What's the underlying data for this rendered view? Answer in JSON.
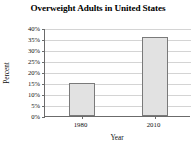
{
  "chart_data": {
    "type": "bar",
    "title": "Overweight Adults in United States",
    "xlabel": "Year",
    "ylabel": "Percent",
    "categories": [
      "1980",
      "2010"
    ],
    "values": [
      15,
      36
    ],
    "ylim": [
      0,
      40
    ],
    "ytick_labels": [
      "0%",
      "5%",
      "10%",
      "15%",
      "20%",
      "25%",
      "30%",
      "35%",
      "40%"
    ],
    "ytick_values": [
      0,
      5,
      10,
      15,
      20,
      25,
      30,
      35,
      40
    ],
    "grid": true,
    "legend": "none",
    "bar_fill_color": "#e2e2e2",
    "bar_border_color": "#7a7a7a",
    "gridline_color": "#d4d4d4",
    "axis_color": "#6b6b6b",
    "background_color": "#ffffff"
  }
}
